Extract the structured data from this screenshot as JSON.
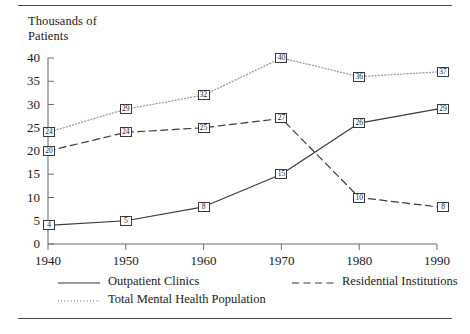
{
  "chart_data": {
    "type": "line",
    "title": "",
    "ylabel": "Thousands of\nPatients",
    "xlabel": "",
    "x": [
      1940,
      1950,
      1960,
      1970,
      1980,
      1990
    ],
    "xticklabels": [
      "1940",
      "1950",
      "1960",
      "1970",
      "1980",
      "1990"
    ],
    "yticklabels": [
      "0",
      "5",
      "10",
      "15",
      "20",
      "25",
      "30",
      "35",
      "40"
    ],
    "yticks": [
      0,
      5,
      10,
      15,
      20,
      25,
      30,
      35,
      40
    ],
    "ylim": [
      0,
      40
    ],
    "xlim": [
      1940,
      1990
    ],
    "grid": false,
    "legend_position": "bottom",
    "series": [
      {
        "name": "Outpatient Clinics",
        "style": "solid",
        "color": "#3a3a3a",
        "values": [
          4,
          5,
          8,
          15,
          26,
          29
        ],
        "labels": [
          "4",
          "5",
          "8",
          "15",
          "26",
          "29"
        ]
      },
      {
        "name": "Total Mental Health Population",
        "style": "dotted",
        "color": "#9a9a9a",
        "values": [
          24,
          29,
          32,
          40,
          36,
          37
        ],
        "labels": [
          "24",
          "29",
          "32",
          "40",
          "36",
          "37"
        ]
      },
      {
        "name": "Residential Institutions",
        "style": "dashed",
        "color": "#3a3a3a",
        "values": [
          20,
          24,
          25,
          27,
          10,
          8
        ],
        "labels": [
          "20",
          "24",
          "25",
          "27",
          "10",
          "8"
        ]
      }
    ]
  },
  "legend": {
    "entries": [
      {
        "label": "Outpatient Clinics",
        "style": "solid"
      },
      {
        "label": "Total Mental Health Population",
        "style": "dotted"
      },
      {
        "label": "Residential Institutions",
        "style": "dashed"
      }
    ]
  }
}
